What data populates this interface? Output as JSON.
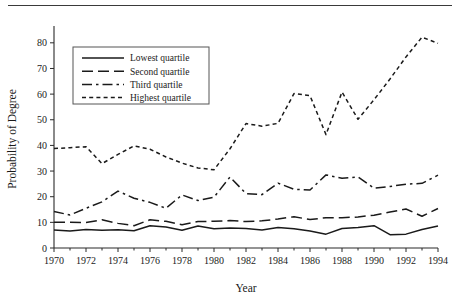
{
  "figure": {
    "has_top_rule": true,
    "background": "#ffffff",
    "ink_color": "#1a1a1a"
  },
  "chart_data": {
    "type": "line",
    "title": "",
    "subtitle": "",
    "xlabel": "Year",
    "ylabel": "Probability of Degree",
    "xlim": [
      1970,
      1994
    ],
    "ylim": [
      0,
      85
    ],
    "ytick_values": [
      0,
      10,
      20,
      30,
      40,
      50,
      60,
      70,
      80
    ],
    "ytick_labels": [
      "0",
      "10",
      "20",
      "30",
      "40",
      "50",
      "60",
      "70",
      "80"
    ],
    "xtick_values": [
      1970,
      1972,
      1974,
      1976,
      1978,
      1980,
      1982,
      1984,
      1986,
      1988,
      1990,
      1992,
      1994
    ],
    "xtick_labels": [
      "1970",
      "1972",
      "1974",
      "1976",
      "1978",
      "1980",
      "1982",
      "1984",
      "1986",
      "1988",
      "1990",
      "1992",
      "1994"
    ],
    "xtick_minor_values": [
      1971,
      1973,
      1975,
      1977,
      1979,
      1981,
      1983,
      1985,
      1987,
      1989,
      1991,
      1993
    ],
    "grid": false,
    "legend_position": "upper left",
    "x": [
      1970,
      1971,
      1972,
      1973,
      1974,
      1975,
      1976,
      1977,
      1978,
      1979,
      1980,
      1981,
      1982,
      1983,
      1984,
      1985,
      1986,
      1987,
      1988,
      1989,
      1990,
      1991,
      1992,
      1993,
      1994
    ],
    "series": [
      {
        "name": "Lowest quartile",
        "dash": "solid",
        "values": [
          7.0,
          6.6,
          7.2,
          6.9,
          7.1,
          6.7,
          8.7,
          8.2,
          6.9,
          8.6,
          7.5,
          7.8,
          7.6,
          7.0,
          8.0,
          7.5,
          6.6,
          5.4,
          7.6,
          8.0,
          8.7,
          5.2,
          5.4,
          7.2,
          8.6
        ]
      },
      {
        "name": "Second quartile",
        "dash": "long-dash",
        "values": [
          10.0,
          10.0,
          9.9,
          11.0,
          9.6,
          8.7,
          11.0,
          10.4,
          9.1,
          10.3,
          10.4,
          10.7,
          10.3,
          10.6,
          11.3,
          12.2,
          11.1,
          11.8,
          11.8,
          12.1,
          12.8,
          14.0,
          15.2,
          12.4,
          15.4
        ]
      },
      {
        "name": "Third quartile",
        "dash": "dash-dot",
        "values": [
          14.2,
          12.9,
          15.5,
          18.0,
          22.2,
          19.4,
          17.8,
          15.5,
          20.7,
          18.5,
          19.8,
          27.7,
          21.2,
          20.8,
          25.3,
          22.9,
          22.6,
          28.5,
          27.2,
          27.7,
          23.3,
          24.0,
          24.9,
          25.2,
          28.4
        ]
      },
      {
        "name": "Highest quartile",
        "dash": "short-dash",
        "values": [
          38.8,
          39.1,
          39.5,
          32.9,
          36.5,
          39.8,
          38.5,
          35.5,
          33.1,
          31.2,
          30.5,
          38.7,
          48.5,
          47.5,
          48.6,
          60.2,
          59.4,
          44.2,
          60.8,
          50.2,
          57.8,
          65.9,
          74.5,
          82.2,
          79.8
        ]
      }
    ]
  },
  "legend": {
    "items": [
      {
        "label": "Lowest quartile",
        "dash": "solid"
      },
      {
        "label": "Second quartile",
        "dash": "long-dash"
      },
      {
        "label": "Third quartile",
        "dash": "dash-dot"
      },
      {
        "label": "Highest quartile",
        "dash": "short-dash"
      }
    ]
  }
}
